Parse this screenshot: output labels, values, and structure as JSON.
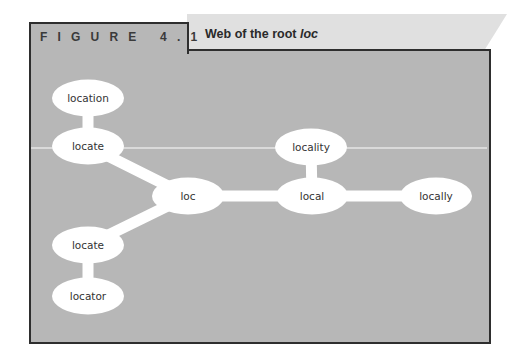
{
  "figure": {
    "label": "FIGURE 4.1",
    "title_prefix": "Web of the root ",
    "title_root": "loc"
  },
  "colors": {
    "panel_bg": "#b7b7b7",
    "border": "#2e2e2e",
    "title_band": "#e0e0e0",
    "node_fill": "#ffffff",
    "connector": "#ffffff"
  },
  "diagram": {
    "root": "loc",
    "nodes": [
      {
        "id": "location",
        "label": "location",
        "cx": 88,
        "cy": 98
      },
      {
        "id": "locate_top",
        "label": "locate",
        "cx": 88,
        "cy": 146
      },
      {
        "id": "loc",
        "label": "loc",
        "cx": 188,
        "cy": 196
      },
      {
        "id": "locality",
        "label": "locality",
        "cx": 311,
        "cy": 147
      },
      {
        "id": "local",
        "label": "local",
        "cx": 312,
        "cy": 196
      },
      {
        "id": "locally",
        "label": "locally",
        "cx": 436,
        "cy": 196
      },
      {
        "id": "locate_bottom",
        "label": "locate",
        "cx": 88,
        "cy": 245
      },
      {
        "id": "locator",
        "label": "locator",
        "cx": 88,
        "cy": 296
      }
    ],
    "edges": [
      [
        "location",
        "locate_top"
      ],
      [
        "locate_top",
        "loc"
      ],
      [
        "loc",
        "local"
      ],
      [
        "locality",
        "local"
      ],
      [
        "local",
        "locally"
      ],
      [
        "loc",
        "locate_bottom"
      ],
      [
        "locate_bottom",
        "locator"
      ]
    ]
  }
}
